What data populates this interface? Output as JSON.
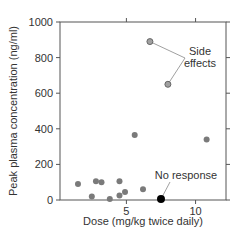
{
  "chart_data": {
    "type": "scatter",
    "title": "",
    "xlabel": "Dose (mg/kg twice daily)",
    "ylabel": "Peak plasma concentration (ng/ml)",
    "xlim": [
      0.2,
      12.2
    ],
    "ylim": [
      0,
      1000
    ],
    "x_ticks": [
      5,
      10
    ],
    "y_ticks": [
      0,
      200,
      400,
      600,
      800,
      1000
    ],
    "x_tick_labels": [
      "5",
      "10"
    ],
    "y_tick_labels": [
      "0",
      "200",
      "400",
      "600",
      "800",
      "1000"
    ],
    "grid": false,
    "legend": null,
    "series": [
      {
        "name": "Patients",
        "color": "#7a7a7a",
        "points": [
          {
            "x": 1.5,
            "y": 90
          },
          {
            "x": 2.5,
            "y": 20
          },
          {
            "x": 2.8,
            "y": 105
          },
          {
            "x": 3.2,
            "y": 100
          },
          {
            "x": 3.8,
            "y": 5
          },
          {
            "x": 4.5,
            "y": 105
          },
          {
            "x": 4.5,
            "y": 25
          },
          {
            "x": 4.9,
            "y": 45
          },
          {
            "x": 5.6,
            "y": 365
          },
          {
            "x": 6.2,
            "y": 60
          },
          {
            "x": 10.8,
            "y": 340
          }
        ]
      },
      {
        "name": "Side effects",
        "color": "#a0a0a0",
        "points": [
          {
            "x": 6.7,
            "y": 890
          },
          {
            "x": 8.0,
            "y": 650
          }
        ]
      },
      {
        "name": "No response",
        "color": "#000000",
        "points": [
          {
            "x": 7.5,
            "y": 5
          }
        ]
      }
    ],
    "annotations": [
      {
        "text_lines": [
          "Side",
          "effects"
        ],
        "targets": [
          {
            "x": 6.7,
            "y": 890
          },
          {
            "x": 8.0,
            "y": 650
          }
        ]
      },
      {
        "text_lines": [
          "No response"
        ],
        "targets": [
          {
            "x": 7.5,
            "y": 5
          }
        ]
      }
    ]
  }
}
